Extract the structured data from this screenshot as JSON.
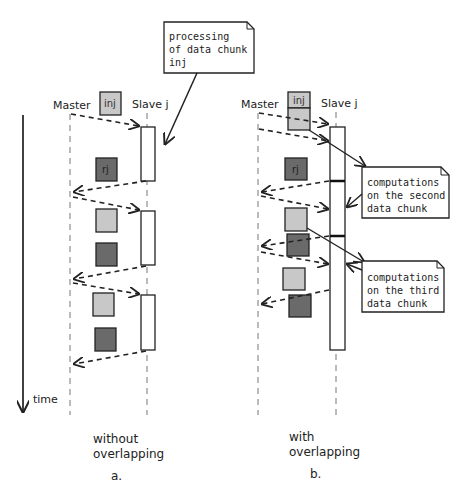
{
  "colors": {
    "light_chunk": "#c8c8c8",
    "dark_chunk": "#6a6a6a",
    "stroke": "#222222",
    "lifeline": "#777777"
  },
  "axis": {
    "time_label": "time"
  },
  "panel_a": {
    "master_label": "Master",
    "slave_label": "Slave j",
    "input_chunk_label": "inj",
    "result_chunk_label": "rj",
    "caption_line1": "without",
    "caption_line2": "overlapping",
    "panel_letter": "a.",
    "callout": {
      "line1": "processing",
      "line2": "of data chunk",
      "line3": "inj"
    }
  },
  "panel_b": {
    "master_label": "Master",
    "slave_label": "Slave j",
    "input_chunk_label": "inj",
    "result_chunk_label": "rj",
    "caption_line1": "with",
    "caption_line2": "overlapping",
    "panel_letter": "b.",
    "callout_second": {
      "line1": "computations",
      "line2": "on the second",
      "line3": "data chunk"
    },
    "callout_third": {
      "line1": "computations",
      "line2": "on the third",
      "line3": "data chunk"
    }
  }
}
